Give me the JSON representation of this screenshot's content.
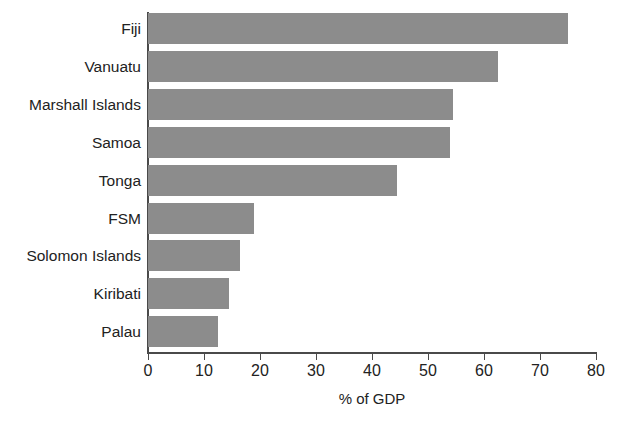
{
  "chart_data": {
    "type": "bar",
    "orientation": "horizontal",
    "title": "",
    "subtitle": "",
    "xlabel": "% of GDP",
    "ylabel": "",
    "xlim": [
      0,
      80
    ],
    "xticks": [
      0,
      10,
      20,
      30,
      40,
      50,
      60,
      70,
      80
    ],
    "xtick_labels": [
      "0",
      "10",
      "20",
      "30",
      "40",
      "50",
      "60",
      "70",
      "80"
    ],
    "grid": false,
    "legend": null,
    "categories": [
      "Fiji",
      "Vanuatu",
      "Marshall Islands",
      "Samoa",
      "Tonga",
      "FSM",
      "Solomon Islands",
      "Kiribati",
      "Palau"
    ],
    "values": [
      75,
      62.5,
      54.5,
      54,
      44.5,
      19,
      16.5,
      14.5,
      12.5
    ],
    "series": [
      {
        "name": "% of GDP",
        "values": [
          75,
          62.5,
          54.5,
          54,
          44.5,
          19,
          16.5,
          14.5,
          12.5
        ]
      }
    ],
    "bar_color": "#8c8c8c",
    "axis_color": "#4a4a4a",
    "background_color": "#ffffff"
  }
}
